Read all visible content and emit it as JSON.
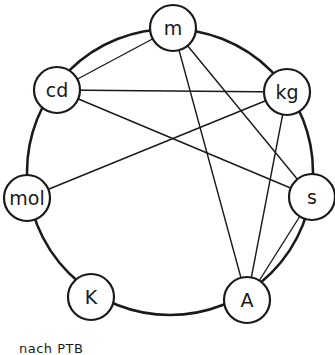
{
  "diagram": {
    "ring": {
      "cx": 170,
      "cy": 172,
      "r": 143
    },
    "node_radius": 23,
    "nodes": [
      {
        "id": "m",
        "label": "m",
        "x": 173,
        "y": 28
      },
      {
        "id": "kg",
        "label": "kg",
        "x": 287,
        "y": 92
      },
      {
        "id": "s",
        "label": "s",
        "x": 312,
        "y": 197
      },
      {
        "id": "A",
        "label": "A",
        "x": 247,
        "y": 300
      },
      {
        "id": "K",
        "label": "K",
        "x": 91,
        "y": 297
      },
      {
        "id": "mol",
        "label": "mol",
        "x": 27,
        "y": 198
      },
      {
        "id": "cd",
        "label": "cd",
        "x": 57,
        "y": 90
      }
    ],
    "edges": [
      [
        "cd",
        "m"
      ],
      [
        "m",
        "A"
      ],
      [
        "m",
        "s"
      ],
      [
        "cd",
        "kg"
      ],
      [
        "cd",
        "s"
      ],
      [
        "mol",
        "kg"
      ],
      [
        "kg",
        "A"
      ],
      [
        "s",
        "A"
      ]
    ]
  },
  "caption": "nach PTB"
}
